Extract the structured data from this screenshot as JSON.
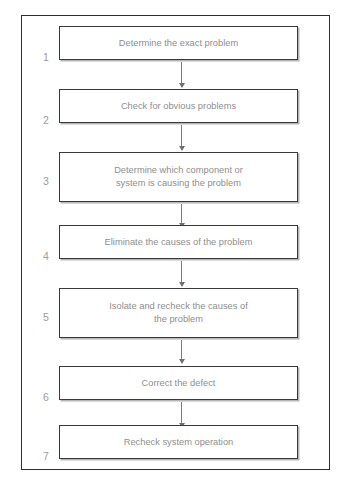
{
  "figure": {
    "type": "flowchart",
    "orientation": "vertical",
    "frame_color": "#2e2e2e",
    "box_border_color": "#3a3a3a",
    "text_color": "#8e8e8e",
    "number_color": "#9a9a9a",
    "connector_color": "#7d7d7d",
    "background": "#ffffff"
  },
  "steps": [
    {
      "number": "1",
      "label": "Determine the exact problem",
      "lines": 1
    },
    {
      "number": "2",
      "label": "Check for obvious problems",
      "lines": 1
    },
    {
      "number": "3",
      "label": "Determine which component or\nsystem is causing the problem",
      "lines": 2
    },
    {
      "number": "4",
      "label": "Eliminate the causes of the problem",
      "lines": 1
    },
    {
      "number": "5",
      "label": "Isolate and recheck the causes of\nthe problem",
      "lines": 2
    },
    {
      "number": "6",
      "label": "Correct the defect",
      "lines": 1
    },
    {
      "number": "7",
      "label": "Recheck system operation",
      "lines": 1
    }
  ]
}
